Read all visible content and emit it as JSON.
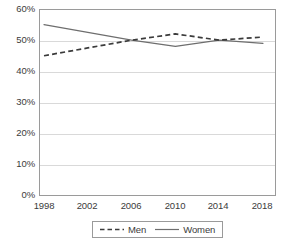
{
  "chart_data": {
    "type": "line",
    "title": "",
    "subtitle": "",
    "xlabel": "",
    "ylabel": "",
    "x": [
      1998,
      2002,
      2006,
      2010,
      2014,
      2018
    ],
    "categories": [
      "1998",
      "2002",
      "2006",
      "2010",
      "2014",
      "2018"
    ],
    "series": [
      {
        "name": "Men",
        "style": "dashed",
        "color": "#3b3b3b",
        "values": [
          45,
          47.5,
          50,
          52,
          50,
          51
        ]
      },
      {
        "name": "Women",
        "style": "solid",
        "color": "#6e6e6e",
        "values": [
          55,
          52.5,
          50,
          48,
          50,
          49
        ]
      }
    ],
    "ylim": [
      0,
      60
    ],
    "ytick_values": [
      0,
      10,
      20,
      30,
      40,
      50,
      60
    ],
    "ytick_labels": [
      "0%",
      "10%",
      "20%",
      "30%",
      "40%",
      "50%",
      "60%"
    ],
    "xlim": [
      1998,
      2018
    ],
    "grid": "horizontal",
    "legend_position": "bottom",
    "legend": [
      {
        "label": "Men",
        "style": "dashed"
      },
      {
        "label": "Women",
        "style": "solid"
      }
    ],
    "colors": {
      "men_line": "#3b3b3b",
      "women_line": "#6e6e6e",
      "gridline": "#d9d9d9",
      "axis": "#9a9a9a",
      "text": "#3b3b3b",
      "background": "#ffffff"
    }
  }
}
